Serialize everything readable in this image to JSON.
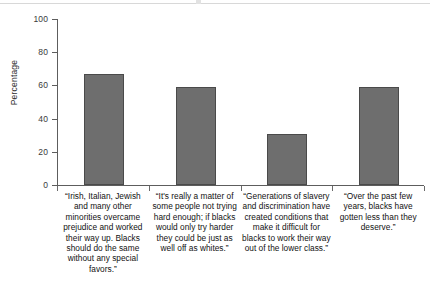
{
  "chart_data": {
    "type": "bar",
    "title": "",
    "subtitle": "",
    "xlabel": "",
    "ylabel": "Percentage",
    "ylim": [
      0,
      100
    ],
    "yticks": [
      0,
      20,
      40,
      60,
      80,
      100
    ],
    "ytick_labels": [
      "0",
      "20",
      "40",
      "60",
      "80",
      "100"
    ],
    "grid": false,
    "legend": null,
    "bar_color": "#6e6e6e",
    "bar_outline_color": "#4a4a4a",
    "axis_color": "#5d5d5d",
    "categories": [
      "“Irish, Italian, Jewish and many other minorities overcame prejudice and worked their way up. Blacks should do the same without any special favors.”",
      "“It's really a matter of some people not trying hard enough; if blacks would only try harder they could be just as well off as whites.”",
      "“Generations of slavery and discrimination have created conditions that make it difficult for blacks to work their way out of the lower class.”",
      "“Over the past few years, blacks have gotten less than they deserve.”"
    ],
    "values": [
      67,
      59,
      31,
      59
    ]
  },
  "axis": {
    "y_title": "Percentage",
    "tick_0": "0",
    "tick_20": "20",
    "tick_40": "40",
    "tick_60": "60",
    "tick_80": "80",
    "tick_100": "100"
  },
  "labels": {
    "cat_1": "“Irish, Italian, Jewish and many other minorities overcame prejudice and worked their way up. Blacks should do the same without any special favors.”",
    "cat_2": "“It's really a matter of some people not trying hard enough; if blacks would only try harder they could be just as well off as whites.”",
    "cat_3": "“Generations of slavery and discrimination have created conditions that make it difficult for blacks to work their way out of the lower class.”",
    "cat_4": "“Over the past few years, blacks have gotten less than they deserve.”"
  }
}
